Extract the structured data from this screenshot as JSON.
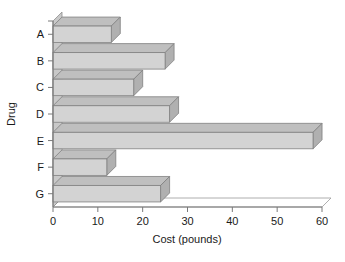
{
  "chart_data": {
    "type": "bar",
    "orientation": "horizontal",
    "style": "3d",
    "title": "",
    "subtitle": "",
    "xlabel": "Cost (pounds)",
    "ylabel": "Drug",
    "categories": [
      "A",
      "B",
      "C",
      "D",
      "E",
      "F",
      "G"
    ],
    "values": [
      13,
      25,
      18,
      26,
      58,
      12,
      24
    ],
    "series": [
      {
        "name": "Cost",
        "values": [
          13,
          25,
          18,
          26,
          58,
          12,
          24
        ]
      }
    ],
    "xlim": [
      0,
      60
    ],
    "ylim": [
      0,
      7
    ],
    "xticks": [
      0,
      10,
      20,
      30,
      40,
      50,
      60
    ],
    "xtick_labels": [
      "0",
      "10",
      "20",
      "30",
      "40",
      "50",
      "60"
    ],
    "ytick_labels": [
      "A",
      "B",
      "C",
      "D",
      "E",
      "F",
      "G"
    ],
    "grid": false,
    "legend": false,
    "legend_position": "none",
    "bar_face_color": "#d3d3d3",
    "bar_top_color": "#bfbfbf",
    "bar_side_color": "#b0b0b0",
    "bar_edge_color": "#808080",
    "axis_color": "#7a7a7a",
    "background_color": "#ffffff",
    "text_color": "#1a1a1a"
  },
  "axes": {
    "x_title": "Cost (pounds)",
    "y_title": "Drug"
  },
  "ticks": {
    "x": [
      "0",
      "10",
      "20",
      "30",
      "40",
      "50",
      "60"
    ],
    "y": [
      "A",
      "B",
      "C",
      "D",
      "E",
      "F",
      "G"
    ]
  }
}
